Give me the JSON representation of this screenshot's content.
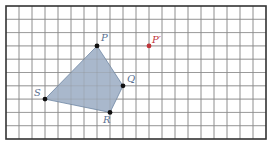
{
  "grid": {
    "cols": 20,
    "rows": 10,
    "origin_px": [
      6,
      6
    ],
    "cell_w": 13,
    "cell_h": 13.3,
    "line_color": "#8a8a8a",
    "frame_color": "#333333"
  },
  "polygon": {
    "name": "PQRS",
    "fill": "#a9b8cc",
    "stroke": "#6f86a3",
    "vertices": [
      "P",
      "Q",
      "R",
      "S"
    ]
  },
  "points": {
    "P": {
      "label": "P",
      "x": 7,
      "y": 3,
      "color": "#111111",
      "label_color": "#5a7090",
      "dx": 4,
      "dy": -5
    },
    "Q": {
      "label": "Q",
      "x": 9,
      "y": 6,
      "color": "#111111",
      "label_color": "#5a7090",
      "dx": 4,
      "dy": -4
    },
    "R": {
      "label": "R",
      "x": 8,
      "y": 8,
      "color": "#111111",
      "label_color": "#5a7090",
      "dx": -7,
      "dy": 11
    },
    "S": {
      "label": "S",
      "x": 3,
      "y": 7,
      "color": "#111111",
      "label_color": "#5a7090",
      "dx": -11,
      "dy": -3
    },
    "P_prime": {
      "label": "P′",
      "x": 11,
      "y": 3,
      "color": "#c0353a",
      "label_color": "#c0353a",
      "dx": 3,
      "dy": -3
    }
  }
}
